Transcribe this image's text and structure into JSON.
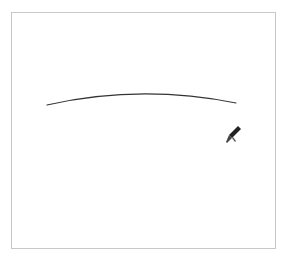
{
  "canvas": {
    "border_color": "#c8c8c8",
    "background": "#ffffff"
  },
  "stroke": {
    "type": "arc",
    "color": "#333333",
    "width": 1.2,
    "start": [
      47,
      105
    ],
    "control": [
      140,
      84
    ],
    "end": [
      236,
      103
    ]
  },
  "cursor": {
    "icon": "pen-cursor-icon",
    "position": [
      232,
      138
    ]
  }
}
